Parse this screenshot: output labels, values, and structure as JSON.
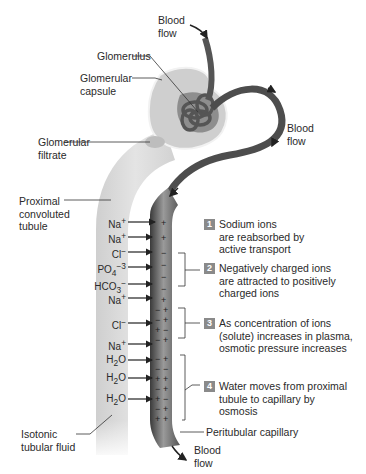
{
  "labels": {
    "blood_flow_top": "Blood\nflow",
    "glomerulus": "Glomerulus",
    "glomerular_capsule": "Glomerular\ncapsule",
    "blood_flow_right": "Blood\nflow",
    "glomerular_filtrate": "Glomerular\nfiltrate",
    "proximal_tubule": "Proximal\nconvoluted\ntubule",
    "isotonic_fluid": "Isotonic\ntubular fluid",
    "peritubular_capillary": "Peritubular capillary",
    "blood_flow_bottom": "Blood\nflow"
  },
  "ions": [
    {
      "name": "Na",
      "sup": "+",
      "sub": ""
    },
    {
      "name": "Na",
      "sup": "+",
      "sub": ""
    },
    {
      "name": "Cl",
      "sup": "−",
      "sub": ""
    },
    {
      "name": "PO",
      "sup": "−3",
      "sub": "4"
    },
    {
      "name": "HCO",
      "sup": "−",
      "sub": "3"
    },
    {
      "name": "Na",
      "sup": "+",
      "sub": ""
    },
    {
      "name": "Cl",
      "sup": "−",
      "sub": ""
    },
    {
      "name": "Na",
      "sup": "+",
      "sub": ""
    },
    {
      "name": "H",
      "sup": "",
      "sub": "2",
      "tail": "O"
    },
    {
      "name": "H",
      "sup": "",
      "sub": "2",
      "tail": "O"
    },
    {
      "name": "H",
      "sup": "",
      "sub": "2",
      "tail": "O"
    }
  ],
  "steps": [
    {
      "num": "1",
      "text": "Sodium ions\nare reabsorbed by\nactive transport"
    },
    {
      "num": "2",
      "text": "Negatively charged ions\nare attracted to positively\ncharged ions"
    },
    {
      "num": "3",
      "text": "As concentration of ions\n(solute) increases in plasma,\nosmotic pressure increases"
    },
    {
      "num": "4",
      "text": "Water moves from proximal\ntubule to capillary by\nosmosis"
    }
  ],
  "colors": {
    "tubule": "#d9d9d9",
    "capillary_dark": "#4a4a4a",
    "capillary_mid": "#8c8c8c",
    "badge": "#8a8a8a"
  }
}
